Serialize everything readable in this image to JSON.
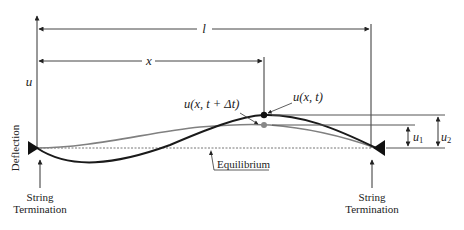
{
  "diagram": {
    "axis_label": "u",
    "vertical_label": "Deflection",
    "length_label": "l",
    "position_label": "x",
    "displacement_now": "u(x, t)",
    "displacement_next": "u(x, t + Δt)",
    "equilibrium_label": "Equilibrium",
    "u1_label": "u",
    "u1_sub": "1",
    "u2_label": "u",
    "u2_sub": "2",
    "left_termination_line1": "String",
    "left_termination_line2": "Termination",
    "right_termination_line1": "String",
    "right_termination_line2": "Termination"
  },
  "colors": {
    "curve_now": "#1a1a1a",
    "curve_next": "#808080",
    "lines": "#333333",
    "equilibrium": "#777777"
  }
}
